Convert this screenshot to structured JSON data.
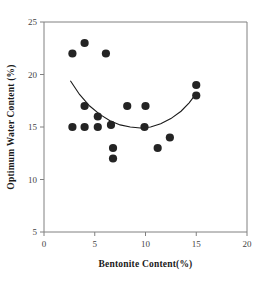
{
  "chart_data": {
    "type": "scatter",
    "title": "",
    "xlabel": "Bentonite Content(%)",
    "ylabel": "Optimum Water Content (%)",
    "xlim": [
      0,
      20
    ],
    "ylim": [
      5,
      25
    ],
    "xticks": [
      "0",
      "5",
      "10",
      "15",
      "20"
    ],
    "yticks": [
      "5",
      "10",
      "15",
      "20",
      "25"
    ],
    "grid": false,
    "legend": "none",
    "series": [
      {
        "name": "Optimum water content data",
        "marker": "filled-circle",
        "color": "#242424",
        "points": [
          {
            "x": 2.8,
            "y": 22.0
          },
          {
            "x": 4.0,
            "y": 23.0
          },
          {
            "x": 6.1,
            "y": 22.0
          },
          {
            "x": 4.0,
            "y": 17.0
          },
          {
            "x": 5.3,
            "y": 16.0
          },
          {
            "x": 2.8,
            "y": 15.0
          },
          {
            "x": 4.0,
            "y": 15.0
          },
          {
            "x": 5.3,
            "y": 15.0
          },
          {
            "x": 6.6,
            "y": 15.2
          },
          {
            "x": 8.2,
            "y": 17.0
          },
          {
            "x": 10.0,
            "y": 17.0
          },
          {
            "x": 9.9,
            "y": 15.0
          },
          {
            "x": 6.8,
            "y": 13.0
          },
          {
            "x": 6.8,
            "y": 12.0
          },
          {
            "x": 11.2,
            "y": 13.0
          },
          {
            "x": 12.4,
            "y": 14.0
          },
          {
            "x": 15.0,
            "y": 19.0
          },
          {
            "x": 15.0,
            "y": 18.0
          }
        ]
      }
    ],
    "trendline": {
      "name": "quadratic fit",
      "color": "#1a1a1a",
      "points": [
        {
          "x": 2.6,
          "y": 19.4
        },
        {
          "x": 3.5,
          "y": 18.1
        },
        {
          "x": 4.5,
          "y": 17.0
        },
        {
          "x": 5.5,
          "y": 16.2
        },
        {
          "x": 6.5,
          "y": 15.6
        },
        {
          "x": 7.5,
          "y": 15.2
        },
        {
          "x": 8.5,
          "y": 15.0
        },
        {
          "x": 9.5,
          "y": 14.9
        },
        {
          "x": 10.5,
          "y": 15.0
        },
        {
          "x": 11.5,
          "y": 15.3
        },
        {
          "x": 12.5,
          "y": 15.8
        },
        {
          "x": 13.5,
          "y": 16.5
        },
        {
          "x": 14.3,
          "y": 17.3
        },
        {
          "x": 15.0,
          "y": 18.2
        }
      ]
    }
  }
}
